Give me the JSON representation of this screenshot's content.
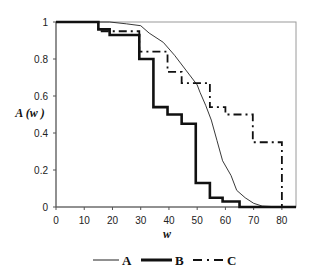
{
  "chart_data": {
    "type": "line",
    "title": "",
    "xlabel": "w",
    "ylabel": "A (w )",
    "xlim": [
      0,
      85
    ],
    "ylim": [
      0,
      1
    ],
    "xticks": [
      0,
      10,
      20,
      30,
      40,
      50,
      60,
      70,
      80
    ],
    "yticks": [
      0,
      0.2,
      0.4,
      0.6,
      0.8,
      1
    ],
    "ytick_labels": [
      "0",
      "0.2",
      "0.4",
      "0.6",
      "0.8",
      "1"
    ],
    "grid": false,
    "legend_position": "bottom",
    "series": [
      {
        "name": "A",
        "style": "thin-solid",
        "x": [
          0,
          19,
          25,
          30,
          33,
          38,
          42,
          46,
          50,
          51,
          53,
          55,
          57,
          59,
          62,
          64,
          67,
          70,
          73,
          80,
          85
        ],
        "y": [
          1.0,
          1.0,
          0.99,
          0.98,
          0.94,
          0.89,
          0.82,
          0.74,
          0.66,
          0.62,
          0.55,
          0.47,
          0.36,
          0.25,
          0.17,
          0.09,
          0.05,
          0.02,
          0.005,
          0.0,
          0.0
        ]
      },
      {
        "name": "B",
        "style": "thick-solid-step",
        "x": [
          0,
          15,
          19,
          29.5,
          34.5,
          39.5,
          44.5,
          49.5,
          54.5,
          59,
          65,
          85
        ],
        "y": [
          1.0,
          0.96,
          0.93,
          0.8,
          0.54,
          0.5,
          0.45,
          0.13,
          0.05,
          0.03,
          0.0,
          0.0
        ]
      },
      {
        "name": "C",
        "style": "dash-dot-step",
        "x": [
          0,
          15,
          29.5,
          39.5,
          44.5,
          54.5,
          60,
          69.7,
          80,
          85
        ],
        "y": [
          1.0,
          0.95,
          0.84,
          0.73,
          0.67,
          0.54,
          0.5,
          0.35,
          0.0,
          0.0
        ]
      }
    ]
  },
  "legend": {
    "items": [
      {
        "label": "A"
      },
      {
        "label": "B"
      },
      {
        "label": "C"
      }
    ]
  }
}
